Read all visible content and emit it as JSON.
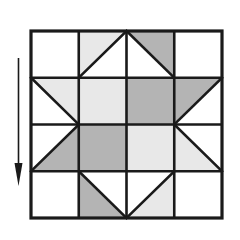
{
  "figure": {
    "kind": "quilt-block-diagram",
    "background_color": "#ffffff"
  },
  "palette": {
    "white": "#ffffff",
    "light_gray": "#e8e8e8",
    "dark_gray": "#b4b4b4",
    "line": "#1a1a1a",
    "arrow": "#1a1a1a"
  },
  "block": {
    "x": 31,
    "y": 31,
    "width": 191,
    "height": 187,
    "rows": 4,
    "columns": 4,
    "outer_border_width": 3.2,
    "inner_line_width": 2.6,
    "diagonal_line_width": 2.6,
    "cells": [
      {
        "row": 0,
        "col": 0,
        "shape": "square",
        "fill": "white",
        "name": "cell-r0c0"
      },
      {
        "row": 0,
        "col": 1,
        "shape": "tri-top-left",
        "fill": "light_gray",
        "name": "cell-r0c1"
      },
      {
        "row": 0,
        "col": 2,
        "shape": "tri-top-right",
        "fill": "dark_gray",
        "name": "cell-r0c2"
      },
      {
        "row": 0,
        "col": 3,
        "shape": "square",
        "fill": "white",
        "name": "cell-r0c3"
      },
      {
        "row": 1,
        "col": 0,
        "shape": "tri-top-right",
        "fill": "light_gray",
        "name": "cell-r1c0"
      },
      {
        "row": 1,
        "col": 1,
        "shape": "square",
        "fill": "light_gray",
        "name": "cell-r1c1"
      },
      {
        "row": 1,
        "col": 2,
        "shape": "square",
        "fill": "dark_gray",
        "name": "cell-r1c2"
      },
      {
        "row": 1,
        "col": 3,
        "shape": "tri-top-left",
        "fill": "dark_gray",
        "name": "cell-r1c3"
      },
      {
        "row": 2,
        "col": 0,
        "shape": "tri-bottom-right",
        "fill": "dark_gray",
        "name": "cell-r2c0"
      },
      {
        "row": 2,
        "col": 1,
        "shape": "square",
        "fill": "dark_gray",
        "name": "cell-r2c1"
      },
      {
        "row": 2,
        "col": 2,
        "shape": "square",
        "fill": "light_gray",
        "name": "cell-r2c2"
      },
      {
        "row": 2,
        "col": 3,
        "shape": "tri-bottom-left",
        "fill": "light_gray",
        "name": "cell-r2c3"
      },
      {
        "row": 3,
        "col": 0,
        "shape": "square",
        "fill": "white",
        "name": "cell-r3c0"
      },
      {
        "row": 3,
        "col": 1,
        "shape": "tri-bottom-left",
        "fill": "dark_gray",
        "name": "cell-r3c1"
      },
      {
        "row": 3,
        "col": 2,
        "shape": "tri-bottom-right",
        "fill": "light_gray",
        "name": "cell-r3c2"
      },
      {
        "row": 3,
        "col": 3,
        "shape": "square",
        "fill": "white",
        "name": "cell-r3c3"
      }
    ]
  },
  "arrow": {
    "label": "direction-arrow-down",
    "direction": "down",
    "shaft_x": 18.5,
    "shaft_top_y": 58,
    "shaft_bottom_y": 168,
    "shaft_width": 1.6,
    "head_left_x": 14.5,
    "head_right_x": 22.5,
    "head_top_y": 163,
    "head_tip_y": 186
  }
}
